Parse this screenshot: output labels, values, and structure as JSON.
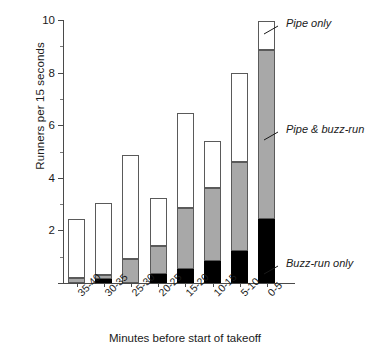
{
  "chart_data": {
    "type": "bar",
    "stacked": true,
    "title": "",
    "xlabel": "Minutes before start of takeoff",
    "ylabel": "Runners per 15 seconds",
    "categories": [
      "35-40",
      "30-35",
      "25-30",
      "20-25",
      "15-20",
      "10-15",
      "5-10",
      "0-5"
    ],
    "series": [
      {
        "name": "Buzz-run only",
        "color": "#000000",
        "values": [
          0.0,
          0.15,
          0.0,
          0.35,
          0.55,
          0.85,
          1.2,
          2.45
        ]
      },
      {
        "name": "Pipe & buzz-run",
        "color": "#a8a8a8",
        "values": [
          0.2,
          0.15,
          0.9,
          1.05,
          2.3,
          2.75,
          3.4,
          6.4
        ]
      },
      {
        "name": "Pipe only",
        "color": "#ffffff",
        "values": [
          2.25,
          2.75,
          3.95,
          1.85,
          3.6,
          1.8,
          3.4,
          1.1
        ]
      }
    ],
    "totals": [
      2.45,
      3.05,
      4.85,
      3.25,
      6.45,
      5.4,
      8.0,
      9.95
    ],
    "ylim": [
      0,
      10
    ],
    "yticks_major": [
      0,
      2,
      4,
      6,
      8,
      10
    ],
    "yticks_minor": [
      1,
      3,
      5,
      7,
      9
    ],
    "ytick_labels": [
      "",
      "2",
      "4",
      "6",
      "8",
      "10"
    ],
    "grid": false,
    "legend_position": "right-annotations"
  },
  "annotations": {
    "pipe_only": "Pipe only",
    "pipe_and_buzz_run": "Pipe & buzz-run",
    "buzz_run_only": "Buzz-run only"
  },
  "axes": {
    "y_title": "Runners per 15 seconds",
    "x_title": "Minutes before start of takeoff",
    "y_labels": [
      "10",
      "8",
      "6",
      "4",
      "2"
    ],
    "x_labels": [
      "35-40",
      "30-35",
      "25-30",
      "20-25",
      "15-20",
      "10-15",
      "5-10",
      "0-5"
    ]
  }
}
